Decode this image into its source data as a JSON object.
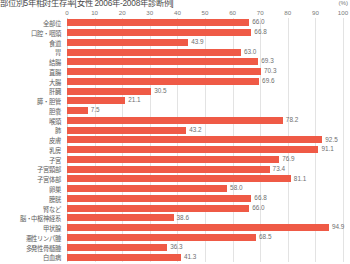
{
  "chart": {
    "title": "部位別5年相対生存率[女性 2006年-2008年診断例]",
    "unit": "(%)"
  },
  "chart_data": {
    "type": "bar",
    "orientation": "horizontal",
    "title": "部位別5年相対生存率[女性 2006年-2008年診断例]",
    "xlabel": "(%)",
    "ylabel": "",
    "xlim": [
      0,
      100
    ],
    "grid": true,
    "legend": null,
    "series_color": "#ef5a46",
    "xticks": [
      0,
      10,
      20,
      30,
      40,
      50,
      60,
      70,
      80,
      90,
      100
    ],
    "categories": [
      "全部位",
      "口腔・咽頭",
      "食道",
      "胃",
      "結腸",
      "直腸",
      "大腸",
      "肝臓",
      "膵・胆管",
      "胆嚢",
      "喉頭",
      "肺",
      "皮膚",
      "乳房",
      "子宮",
      "子宮頸部",
      "子宮体部",
      "卵巣",
      "膀胱",
      "腎など",
      "脳・中枢神経系",
      "甲状腺",
      "悪性リンパ腫",
      "多発性骨髄腫",
      "白血病"
    ],
    "values": [
      66.0,
      66.8,
      43.9,
      63.0,
      69.3,
      70.3,
      69.6,
      30.5,
      21.1,
      7.5,
      78.2,
      43.2,
      92.5,
      91.1,
      76.9,
      73.4,
      81.1,
      58.0,
      66.8,
      66.0,
      38.6,
      94.9,
      68.5,
      36.3,
      41.3
    ]
  }
}
